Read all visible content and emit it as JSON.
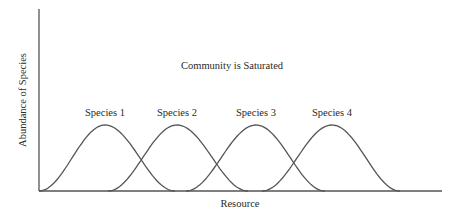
{
  "chart_data": {
    "type": "line",
    "title": "Community is Saturated",
    "xlabel": "Resource",
    "ylabel": "Abundance of Species",
    "grid": false,
    "legend": "none (direct labels above each curve)",
    "series": [
      {
        "name": "Species 1",
        "peak_x": 105,
        "start_x": 39,
        "end_x": 175
      },
      {
        "name": "Species 2",
        "peak_x": 177,
        "start_x": 108,
        "end_x": 248
      },
      {
        "name": "Species 3",
        "peak_x": 256,
        "start_x": 186,
        "end_x": 325
      },
      {
        "name": "Species 4",
        "peak_x": 332,
        "start_x": 262,
        "end_x": 400
      }
    ],
    "curve_shape": "bell (gaussian-like), equal heights, adjacent curves overlap",
    "colors": {
      "line": "#555555",
      "axis": "#555555",
      "text": "#2a2a2a"
    }
  },
  "labels": {
    "title": "Community is Saturated",
    "xlabel": "Resource",
    "ylabel": "Abundance of Species",
    "species": [
      "Species 1",
      "Species 2",
      "Species 3",
      "Species 4"
    ]
  }
}
